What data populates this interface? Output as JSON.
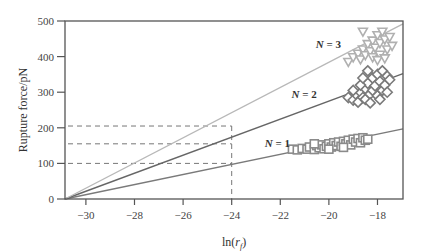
{
  "chart_data": {
    "type": "scatter",
    "title": "",
    "xlabel": "ln(r_f)",
    "ylabel": "Rupture force/pN",
    "xlim": [
      -30.86,
      -16.95
    ],
    "ylim": [
      0,
      500
    ],
    "x_ticks": [
      -30,
      -28,
      -26,
      -24,
      -22,
      -20,
      -18
    ],
    "x_tick_labels": [
      "−30",
      "−28",
      "−26",
      "−24",
      "−22",
      "−20",
      "−18"
    ],
    "y_ticks": [
      0,
      100,
      200,
      300,
      400,
      500
    ],
    "y_tick_labels": [
      "0",
      "100",
      "200",
      "300",
      "400",
      "500"
    ],
    "grid": false,
    "legend": null,
    "fit_lines": [
      {
        "name": "N = 1",
        "x": [
          -30.86,
          -16.95
        ],
        "y": [
          0,
          197
        ],
        "color": "#7a7a7a"
      },
      {
        "name": "N = 2",
        "x": [
          -30.86,
          -16.95
        ],
        "y": [
          0,
          352
        ],
        "color": "#666666"
      },
      {
        "name": "N = 3",
        "x": [
          -30.86,
          -16.95
        ],
        "y": [
          0,
          492
        ],
        "color": "#b8b8b8"
      }
    ],
    "series": [
      {
        "name": "N = 1",
        "marker": "square",
        "color": "#8a8a8a",
        "points": [
          [
            -21.5,
            140
          ],
          [
            -21.3,
            138
          ],
          [
            -21.1,
            142
          ],
          [
            -20.9,
            140
          ],
          [
            -20.8,
            146
          ],
          [
            -20.6,
            139
          ],
          [
            -20.5,
            150
          ],
          [
            -20.4,
            144
          ],
          [
            -20.3,
            152
          ],
          [
            -20.2,
            141
          ],
          [
            -20.1,
            148
          ],
          [
            -20.0,
            155
          ],
          [
            -19.9,
            146
          ],
          [
            -19.8,
            158
          ],
          [
            -19.7,
            150
          ],
          [
            -19.6,
            160
          ],
          [
            -19.5,
            148
          ],
          [
            -19.4,
            162
          ],
          [
            -19.3,
            155
          ],
          [
            -19.2,
            165
          ],
          [
            -19.1,
            152
          ],
          [
            -19.0,
            168
          ],
          [
            -18.9,
            160
          ],
          [
            -18.8,
            170
          ],
          [
            -18.7,
            158
          ],
          [
            -18.6,
            172
          ],
          [
            -18.5,
            165
          ],
          [
            -18.4,
            168
          ],
          [
            -20.6,
            155
          ],
          [
            -20.0,
            140
          ],
          [
            -19.4,
            145
          ]
        ]
      },
      {
        "name": "N = 2",
        "marker": "diamond",
        "color": "#7a7a7a",
        "points": [
          [
            -19.2,
            285
          ],
          [
            -19.0,
            278
          ],
          [
            -18.9,
            295
          ],
          [
            -18.8,
            272
          ],
          [
            -18.7,
            300
          ],
          [
            -18.6,
            285
          ],
          [
            -18.5,
            310
          ],
          [
            -18.5,
            280
          ],
          [
            -18.4,
            325
          ],
          [
            -18.3,
            295
          ],
          [
            -18.2,
            340
          ],
          [
            -18.2,
            305
          ],
          [
            -18.1,
            318
          ],
          [
            -18.0,
            350
          ],
          [
            -18.0,
            290
          ],
          [
            -17.9,
            330
          ],
          [
            -17.8,
            305
          ],
          [
            -17.8,
            360
          ],
          [
            -17.7,
            320
          ],
          [
            -17.6,
            345
          ],
          [
            -17.6,
            300
          ],
          [
            -17.5,
            335
          ],
          [
            -18.4,
            360
          ],
          [
            -18.7,
            320
          ],
          [
            -19.0,
            305
          ],
          [
            -18.3,
            270
          ],
          [
            -17.9,
            280
          ],
          [
            -18.6,
            340
          ]
        ]
      },
      {
        "name": "N = 3",
        "marker": "triangle-down",
        "color": "#b0b0b0",
        "points": [
          [
            -19.2,
            385
          ],
          [
            -19.0,
            398
          ],
          [
            -18.8,
            408
          ],
          [
            -18.7,
            392
          ],
          [
            -18.6,
            420
          ],
          [
            -18.5,
            404
          ],
          [
            -18.4,
            435
          ],
          [
            -18.3,
            415
          ],
          [
            -18.2,
            445
          ],
          [
            -18.2,
            398
          ],
          [
            -18.1,
            425
          ],
          [
            -18.0,
            460
          ],
          [
            -17.9,
            438
          ],
          [
            -17.9,
            405
          ],
          [
            -17.8,
            470
          ],
          [
            -17.7,
            448
          ],
          [
            -17.6,
            420
          ],
          [
            -17.5,
            455
          ],
          [
            -17.4,
            430
          ],
          [
            -18.6,
            470
          ],
          [
            -18.0,
            390
          ],
          [
            -17.7,
            395
          ]
        ]
      }
    ],
    "annotations": [
      {
        "text": "N = 1",
        "x": -21.6,
        "y": 147
      },
      {
        "text": "N = 2",
        "x": -20.5,
        "y": 285
      },
      {
        "text": "N = 3",
        "x": -19.5,
        "y": 424
      },
      {
        "text": "dashed guides",
        "x_line": -24,
        "y_lines": [
          100,
          155,
          205
        ]
      }
    ]
  }
}
